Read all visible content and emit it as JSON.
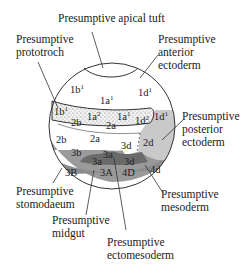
{
  "diagram": {
    "regions": {
      "apical_tuft": "Presumptive apical tuft",
      "prototroch": [
        "Presumptive",
        "prototroch"
      ],
      "anterior_ectoderm": [
        "Presumptive",
        "anterior",
        "ectoderm"
      ],
      "posterior_ectoderm": [
        "Presumptive",
        "posterior",
        "ectoderm"
      ],
      "stomodaeum": [
        "Presumptive",
        "stomodaeum"
      ],
      "mesoderm": [
        "Presumptive",
        "mesoderm"
      ],
      "midgut": [
        "Presumptive",
        "midgut"
      ],
      "ectomesoderm": [
        "Presumptive",
        "ectomesoderm"
      ]
    },
    "cells": {
      "c1b1_top": {
        "base": "1b",
        "sup": "1"
      },
      "c1a1_top": {
        "base": "1a",
        "sup": "1"
      },
      "c1d1_top": {
        "base": "1d",
        "sup": "1"
      },
      "c1b1_band": {
        "base": "1b",
        "sup": "1"
      },
      "c1a2": {
        "base": "1a",
        "sup": "2"
      },
      "c1a1_band": {
        "base": "1a",
        "sup": "1"
      },
      "c1d2": {
        "base": "1d",
        "sup": "2"
      },
      "c1d1_right": {
        "base": "1d",
        "sup": "1"
      },
      "c2b_band": "2b",
      "c2a_band": "2a",
      "c2b": "2b",
      "c2a": "2a",
      "c3d": "3d",
      "c2d": "2d",
      "c3b": "3b",
      "c3a_upper": "3a",
      "c3a": "3a",
      "c3d_dark": "3d",
      "c3B": "3B",
      "c3A": "3A",
      "c4D": "4D",
      "c4d": "4d"
    },
    "colors": {
      "outline": "#333333",
      "stippled_band": "#eeeeee",
      "medium_gray": "#9a9a9a",
      "light_gray": "#c9c9c9",
      "dark_gray": "#6a6a6a",
      "lower_gray": "#8c8c8c"
    }
  }
}
